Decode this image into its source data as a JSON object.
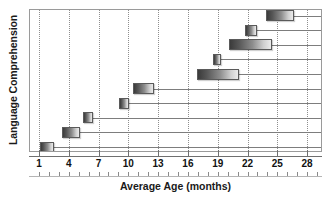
{
  "chart_data": {
    "type": "bar",
    "orientation": "horizontal",
    "title": "",
    "xlabel": "Average Age (months)",
    "ylabel": "Language Comprehension",
    "xlim": [
      0,
      29.5
    ],
    "ylim": [
      0,
      10
    ],
    "grid": {
      "vertical": true,
      "style": "dotted",
      "horizontal_rows": true
    },
    "xticks": [
      1,
      4,
      7,
      10,
      13,
      16,
      19,
      22,
      25,
      28
    ],
    "xtick_labels": [
      "1",
      "4",
      "7",
      "10",
      "13",
      "16",
      "19",
      "22",
      "25",
      "28"
    ],
    "x_minor_tick_interval": 1,
    "yticks": [],
    "ytick_labels": [],
    "legend": null,
    "note": "Each row shows a horizontal range bar (age span in months) with a rule extending from the bar to the right plot edge.",
    "bars": [
      {
        "row": 1,
        "start": 1.0,
        "end": 2.4,
        "width": 1.4
      },
      {
        "row": 2,
        "start": 3.2,
        "end": 5.0,
        "width": 1.8
      },
      {
        "row": 3,
        "start": 5.3,
        "end": 6.3,
        "width": 1.0
      },
      {
        "row": 4,
        "start": 9.0,
        "end": 10.0,
        "width": 1.0
      },
      {
        "row": 5,
        "start": 10.4,
        "end": 12.5,
        "width": 2.1
      },
      {
        "row": 6,
        "start": 16.8,
        "end": 21.0,
        "width": 4.2
      },
      {
        "row": 7,
        "start": 18.4,
        "end": 19.2,
        "width": 0.8
      },
      {
        "row": 8,
        "start": 20.0,
        "end": 24.4,
        "width": 4.4
      },
      {
        "row": 9,
        "start": 21.6,
        "end": 22.9,
        "width": 1.3
      },
      {
        "row": 10,
        "start": 23.8,
        "end": 26.6,
        "width": 2.8
      }
    ],
    "colors": {
      "bar_gradient_dark": "#3b3b3b",
      "bar_gradient_light": "#ebebeb",
      "bar_border": "#5a5a5a",
      "grid": "#8e8e8e",
      "axis": "#6f6f6f",
      "text": "#111111",
      "background": "#ffffff"
    }
  }
}
